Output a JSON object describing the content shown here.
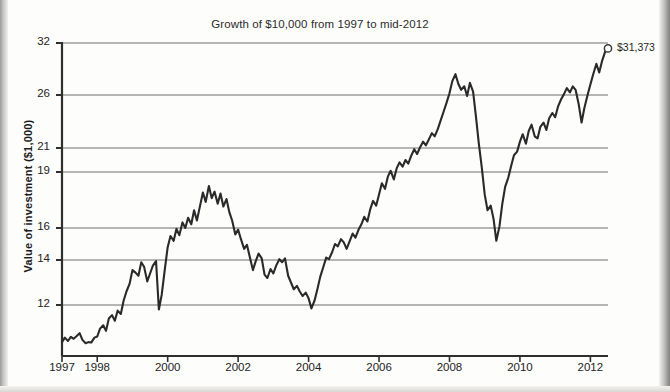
{
  "chart_data": {
    "type": "line",
    "title": "Growth of $10,000 from 1997 to mid-2012",
    "xlabel": "",
    "ylabel": "Value of investment ($1,000)",
    "y_tick_labels": [
      "32",
      "26",
      "21",
      "19",
      "16",
      "14",
      "12"
    ],
    "y_tick_values": [
      32,
      26,
      21,
      19,
      16,
      14,
      12
    ],
    "x_tick_labels": [
      "1997",
      "1998",
      "2000",
      "2002",
      "2004",
      "2006",
      "2008",
      "2010",
      "2012"
    ],
    "x_tick_values": [
      1997,
      1998,
      2000,
      2002,
      2004,
      2006,
      2008,
      2010,
      2012
    ],
    "xlim": [
      1997,
      2012.5
    ],
    "ylim": [
      10.3,
      32.6
    ],
    "yscale": "log",
    "grid": "horizontal",
    "legend": "none",
    "annotations": [
      {
        "label": "$31,373",
        "x": 2012.5,
        "y": 31.373,
        "marker": "open-circle"
      }
    ],
    "series": [
      {
        "name": "Value of investment",
        "color": "#2a2a2a",
        "points": [
          [
            1997.0,
            10.35
          ],
          [
            1997.08,
            10.55
          ],
          [
            1997.17,
            10.4
          ],
          [
            1997.25,
            10.58
          ],
          [
            1997.33,
            10.5
          ],
          [
            1997.42,
            10.62
          ],
          [
            1997.5,
            10.75
          ],
          [
            1997.58,
            10.45
          ],
          [
            1997.67,
            10.3
          ],
          [
            1997.75,
            10.35
          ],
          [
            1997.83,
            10.33
          ],
          [
            1997.92,
            10.55
          ],
          [
            1998.0,
            10.6
          ],
          [
            1998.08,
            10.95
          ],
          [
            1998.17,
            11.1
          ],
          [
            1998.25,
            10.85
          ],
          [
            1998.33,
            11.4
          ],
          [
            1998.42,
            11.55
          ],
          [
            1998.5,
            11.3
          ],
          [
            1998.58,
            11.75
          ],
          [
            1998.67,
            11.6
          ],
          [
            1998.75,
            12.2
          ],
          [
            1998.83,
            12.6
          ],
          [
            1998.92,
            12.95
          ],
          [
            1999.0,
            13.55
          ],
          [
            1999.08,
            13.45
          ],
          [
            1999.17,
            13.3
          ],
          [
            1999.25,
            13.9
          ],
          [
            1999.33,
            13.7
          ],
          [
            1999.42,
            13.05
          ],
          [
            1999.5,
            13.4
          ],
          [
            1999.58,
            13.75
          ],
          [
            1999.67,
            13.95
          ],
          [
            1999.75,
            11.8
          ],
          [
            1999.83,
            12.45
          ],
          [
            1999.92,
            13.6
          ],
          [
            2000.0,
            14.8
          ],
          [
            2000.08,
            15.5
          ],
          [
            2000.17,
            15.2
          ],
          [
            2000.25,
            15.95
          ],
          [
            2000.33,
            15.55
          ],
          [
            2000.42,
            16.3
          ],
          [
            2000.5,
            16.0
          ],
          [
            2000.58,
            16.55
          ],
          [
            2000.67,
            16.2
          ],
          [
            2000.75,
            16.95
          ],
          [
            2000.83,
            16.4
          ],
          [
            2000.92,
            17.2
          ],
          [
            2001.0,
            17.9
          ],
          [
            2001.08,
            17.4
          ],
          [
            2001.17,
            18.25
          ],
          [
            2001.25,
            17.6
          ],
          [
            2001.33,
            17.95
          ],
          [
            2001.42,
            17.3
          ],
          [
            2001.5,
            17.85
          ],
          [
            2001.58,
            17.15
          ],
          [
            2001.67,
            17.55
          ],
          [
            2001.75,
            16.85
          ],
          [
            2001.83,
            16.4
          ],
          [
            2001.92,
            15.6
          ],
          [
            2002.0,
            15.9
          ],
          [
            2002.08,
            15.3
          ],
          [
            2002.17,
            14.7
          ],
          [
            2002.25,
            14.95
          ],
          [
            2002.33,
            14.2
          ],
          [
            2002.42,
            13.55
          ],
          [
            2002.5,
            13.95
          ],
          [
            2002.58,
            14.4
          ],
          [
            2002.67,
            14.1
          ],
          [
            2002.75,
            13.35
          ],
          [
            2002.83,
            13.2
          ],
          [
            2002.92,
            13.6
          ],
          [
            2003.0,
            13.4
          ],
          [
            2003.08,
            13.75
          ],
          [
            2003.17,
            14.05
          ],
          [
            2003.25,
            13.9
          ],
          [
            2003.33,
            14.1
          ],
          [
            2003.42,
            13.3
          ],
          [
            2003.5,
            13.0
          ],
          [
            2003.58,
            12.7
          ],
          [
            2003.67,
            12.85
          ],
          [
            2003.75,
            12.6
          ],
          [
            2003.83,
            12.4
          ],
          [
            2003.92,
            12.55
          ],
          [
            2004.0,
            12.3
          ],
          [
            2004.08,
            11.85
          ],
          [
            2004.17,
            12.2
          ],
          [
            2004.25,
            12.7
          ],
          [
            2004.33,
            13.25
          ],
          [
            2004.42,
            13.7
          ],
          [
            2004.5,
            14.15
          ],
          [
            2004.58,
            14.05
          ],
          [
            2004.67,
            14.5
          ],
          [
            2004.75,
            15.0
          ],
          [
            2004.83,
            14.85
          ],
          [
            2004.92,
            15.3
          ],
          [
            2005.0,
            15.1
          ],
          [
            2005.08,
            14.7
          ],
          [
            2005.17,
            15.2
          ],
          [
            2005.25,
            15.65
          ],
          [
            2005.33,
            15.4
          ],
          [
            2005.42,
            15.9
          ],
          [
            2005.5,
            16.2
          ],
          [
            2005.58,
            16.6
          ],
          [
            2005.67,
            16.35
          ],
          [
            2005.75,
            17.0
          ],
          [
            2005.83,
            17.45
          ],
          [
            2005.92,
            17.2
          ],
          [
            2006.0,
            17.8
          ],
          [
            2006.08,
            18.4
          ],
          [
            2006.17,
            18.1
          ],
          [
            2006.25,
            18.75
          ],
          [
            2006.33,
            19.1
          ],
          [
            2006.42,
            18.6
          ],
          [
            2006.5,
            19.3
          ],
          [
            2006.58,
            19.8
          ],
          [
            2006.67,
            19.45
          ],
          [
            2006.75,
            20.0
          ],
          [
            2006.83,
            19.7
          ],
          [
            2006.92,
            20.4
          ],
          [
            2007.0,
            20.9
          ],
          [
            2007.08,
            20.5
          ],
          [
            2007.17,
            21.1
          ],
          [
            2007.25,
            21.6
          ],
          [
            2007.33,
            21.25
          ],
          [
            2007.42,
            21.85
          ],
          [
            2007.5,
            22.4
          ],
          [
            2007.58,
            22.1
          ],
          [
            2007.67,
            22.8
          ],
          [
            2007.75,
            23.6
          ],
          [
            2007.83,
            24.4
          ],
          [
            2007.92,
            25.3
          ],
          [
            2008.0,
            26.2
          ],
          [
            2008.08,
            27.6
          ],
          [
            2008.17,
            28.4
          ],
          [
            2008.25,
            27.3
          ],
          [
            2008.33,
            26.6
          ],
          [
            2008.42,
            27.0
          ],
          [
            2008.5,
            25.9
          ],
          [
            2008.58,
            27.4
          ],
          [
            2008.67,
            26.4
          ],
          [
            2008.75,
            24.0
          ],
          [
            2008.83,
            21.5
          ],
          [
            2008.92,
            19.3
          ],
          [
            2009.0,
            17.8
          ],
          [
            2009.08,
            16.95
          ],
          [
            2009.17,
            17.2
          ],
          [
            2009.25,
            16.5
          ],
          [
            2009.33,
            15.2
          ],
          [
            2009.42,
            16.1
          ],
          [
            2009.5,
            17.3
          ],
          [
            2009.58,
            18.2
          ],
          [
            2009.67,
            18.7
          ],
          [
            2009.75,
            19.5
          ],
          [
            2009.83,
            20.4
          ],
          [
            2009.92,
            20.7
          ],
          [
            2010.0,
            21.6
          ],
          [
            2010.08,
            22.3
          ],
          [
            2010.17,
            21.4
          ],
          [
            2010.25,
            22.6
          ],
          [
            2010.33,
            23.2
          ],
          [
            2010.42,
            22.1
          ],
          [
            2010.5,
            21.9
          ],
          [
            2010.58,
            23.0
          ],
          [
            2010.67,
            23.4
          ],
          [
            2010.75,
            22.7
          ],
          [
            2010.83,
            23.8
          ],
          [
            2010.92,
            24.3
          ],
          [
            2011.0,
            23.9
          ],
          [
            2011.08,
            24.9
          ],
          [
            2011.17,
            25.6
          ],
          [
            2011.25,
            26.1
          ],
          [
            2011.33,
            26.8
          ],
          [
            2011.42,
            26.3
          ],
          [
            2011.5,
            27.0
          ],
          [
            2011.58,
            26.6
          ],
          [
            2011.67,
            25.1
          ],
          [
            2011.75,
            23.4
          ],
          [
            2011.83,
            24.8
          ],
          [
            2011.92,
            26.0
          ],
          [
            2012.0,
            27.2
          ],
          [
            2012.08,
            28.4
          ],
          [
            2012.17,
            29.6
          ],
          [
            2012.25,
            28.6
          ],
          [
            2012.33,
            29.9
          ],
          [
            2012.42,
            31.0
          ],
          [
            2012.5,
            31.373
          ]
        ]
      }
    ]
  }
}
